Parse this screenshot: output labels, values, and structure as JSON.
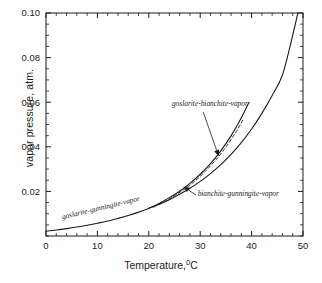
{
  "chart_data": {
    "type": "line",
    "title": "",
    "xlabel": "Temperature,",
    "xlabel_sup": "0",
    "xlabel_unit": "C",
    "ylabel": "vapor pressure, atm.",
    "xlim": [
      0,
      50
    ],
    "ylim": [
      0,
      0.1
    ],
    "xticks": [
      0,
      10,
      20,
      30,
      40,
      50
    ],
    "xtick_labels": [
      "0",
      "10",
      "20",
      "30",
      "40",
      "50"
    ],
    "yticks": [
      0.02,
      0.04,
      0.06,
      0.08,
      0.1
    ],
    "ytick_labels": [
      "0.02",
      "0.04",
      "0.06",
      "0.08",
      "0.10"
    ],
    "x_minor_tick_interval": 2,
    "y_minor_tick_interval": 0.005,
    "grid": false,
    "legend": "none",
    "line_color": "#1a1a1a",
    "frame_color": "#1a1a1a",
    "background": "#ffffff",
    "series": [
      {
        "name": "goslarite-gunningite-vapor / bianchite-gunningite-vapor",
        "style": "solid",
        "comment": "lowest / main continuous curve running full x-range",
        "x": [
          0,
          2,
          4,
          6,
          8,
          10,
          12,
          14,
          16,
          18,
          20,
          22,
          24,
          26,
          28,
          30,
          32,
          34,
          36,
          38,
          40,
          42,
          44,
          46,
          48,
          49
        ],
        "y": [
          0.0022,
          0.0027,
          0.0033,
          0.004,
          0.0048,
          0.0057,
          0.0067,
          0.0079,
          0.0092,
          0.0107,
          0.0124,
          0.0142,
          0.0163,
          0.0187,
          0.0214,
          0.0245,
          0.028,
          0.032,
          0.0366,
          0.0419,
          0.048,
          0.055,
          0.063,
          0.0722,
          0.09,
          0.1
        ]
      },
      {
        "name": "goslarite-bianchite-vapor",
        "style": "solid",
        "comment": "upper branch, diverges near 20 C, terminates near 40 C",
        "x": [
          20,
          22,
          24,
          26,
          28,
          30,
          32,
          34,
          36,
          38,
          39.5
        ],
        "y": [
          0.0124,
          0.0146,
          0.0172,
          0.0201,
          0.0236,
          0.0277,
          0.0325,
          0.0382,
          0.0449,
          0.053,
          0.06
        ]
      },
      {
        "name": "intermediate-dashed-branch",
        "style": "dashed",
        "comment": "short dashed curve between the two solid upper branches",
        "x": [
          21,
          23,
          25,
          27,
          29,
          31,
          33,
          35,
          37,
          38.5
        ],
        "y": [
          0.013,
          0.0153,
          0.018,
          0.0211,
          0.0247,
          0.029,
          0.034,
          0.0399,
          0.0468,
          0.0528
        ]
      }
    ],
    "annotations": [
      {
        "text": "goslarite-bianchite-vapor",
        "text_x": 24.5,
        "text_y": 0.0585,
        "arrow_from_x": 30.6,
        "arrow_from_y": 0.0555,
        "arrow_to_x": 33.6,
        "arrow_to_y": 0.0358
      },
      {
        "text": "bianchite-gunningite-vapor",
        "text_x": 29.5,
        "text_y": 0.0178,
        "arrow_from_x": 29.2,
        "arrow_from_y": 0.0183,
        "arrow_to_x": 26.7,
        "arrow_to_y": 0.0222
      },
      {
        "text": "goslarite-gunningite-vapor",
        "text_x": 3.2,
        "text_y": 0.0075,
        "arrow_from_x": null,
        "arrow_from_y": null,
        "arrow_to_x": null,
        "arrow_to_y": null
      }
    ]
  }
}
